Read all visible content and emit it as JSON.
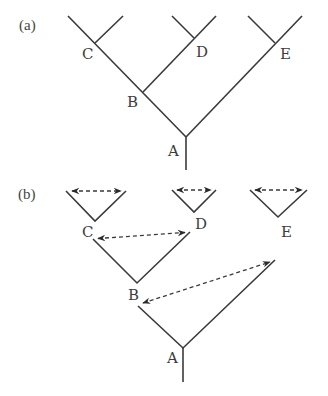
{
  "panels": [
    {
      "id": "a",
      "label": "(a)",
      "description": "Phylogenetic tree with nested branching",
      "nodes": {
        "A": "A",
        "B": "B",
        "C": "C",
        "D": "D",
        "E": "E"
      }
    },
    {
      "id": "b",
      "label": "(b)",
      "description": "Tree decomposed into separate branch pairs with bidirectional dashed arrows indicating comparison between sister branches",
      "nodes": {
        "A": "A",
        "B": "B",
        "C": "C",
        "D": "D",
        "E": "E"
      },
      "comparisons": [
        {
          "node": "C",
          "between": "C descendants"
        },
        {
          "node": "D",
          "between": "D descendants"
        },
        {
          "node": "E",
          "between": "E descendants"
        },
        {
          "node": "B",
          "between": "C and D"
        },
        {
          "node": "A",
          "between": "B and E"
        }
      ]
    }
  ],
  "colors": {
    "line": "#3a3a3a",
    "text": "#3d3d3d",
    "background": "#ffffff"
  }
}
